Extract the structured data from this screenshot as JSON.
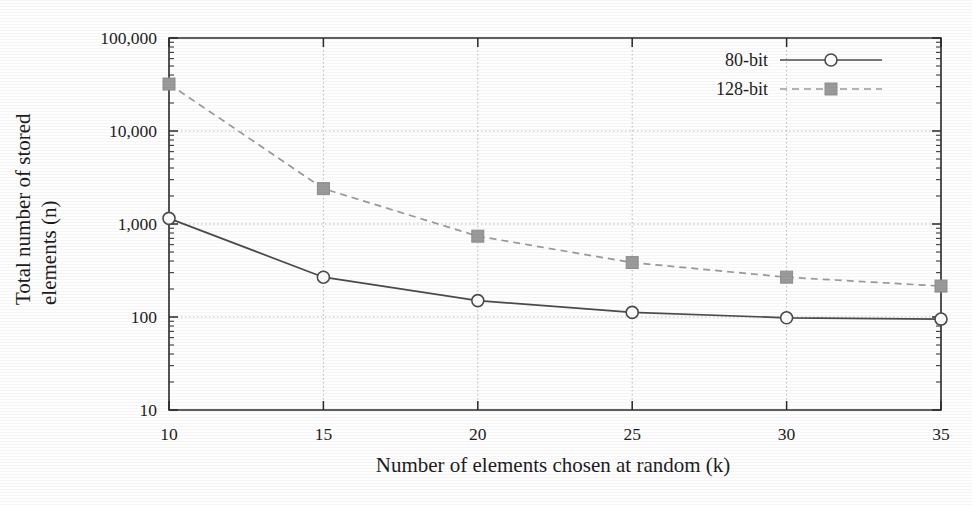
{
  "figure": {
    "background_color": "#fefefe",
    "ink_color": "#222222"
  },
  "chart_data": {
    "type": "line",
    "title": "",
    "subtitle": "",
    "xlabel": "Number of elements chosen at random (k)",
    "ylabel": "Total number of stored",
    "ylabel_line2": "elements (n)",
    "x": [
      10,
      15,
      20,
      25,
      30,
      35
    ],
    "xticklabels": [
      "10",
      "15",
      "20",
      "25",
      "30",
      "35"
    ],
    "xlim": [
      10,
      35
    ],
    "yscale": "log",
    "ylim": [
      10,
      100000
    ],
    "yticks": [
      10,
      100,
      1000,
      10000,
      100000
    ],
    "yticklabels": [
      "10",
      "100",
      "1,000",
      "10,000",
      "100,000"
    ],
    "grid": true,
    "grid_style": "dotted",
    "grid_axis": "both",
    "minor_ticks": true,
    "legend_position": "top-right",
    "series": [
      {
        "name": "80-bit",
        "values": [
          1150,
          268,
          150,
          112,
          98,
          95
        ],
        "color": "#4b4b4b",
        "linestyle": "solid",
        "marker": "open-circle"
      },
      {
        "name": "128-bit",
        "values": [
          32000,
          2400,
          740,
          385,
          268,
          215
        ],
        "color": "#9a9a9a",
        "linestyle": "dashed",
        "marker": "filled-square"
      }
    ]
  },
  "legend": {
    "entries": [
      {
        "label": "80-bit",
        "marker": "open-circle",
        "linestyle": "solid"
      },
      {
        "label": "128-bit",
        "marker": "filled-square",
        "linestyle": "dashed"
      }
    ]
  }
}
